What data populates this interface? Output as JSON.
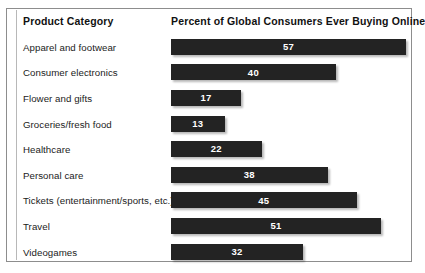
{
  "chart_data": {
    "type": "bar",
    "orientation": "horizontal",
    "title": "",
    "xlabel": "Percent of Global Consumers Ever Buying Online",
    "ylabel": "Product Category",
    "categories": [
      "Apparel and footwear",
      "Consumer electronics",
      "Flower and gifts",
      "Groceries/fresh food",
      "Healthcare",
      "Personal care",
      "Tickets (entertainment/sports, etc.)",
      "Travel",
      "Videogames"
    ],
    "values": [
      57,
      40,
      17,
      13,
      22,
      38,
      45,
      51,
      32
    ],
    "xlim": [
      0,
      57
    ],
    "grid": false,
    "legend": null,
    "data_labels": true,
    "bar_color": "#232323",
    "data_label_color": "#ffffff",
    "background_color": "#ffffff",
    "border_color": "#8d8d8d"
  },
  "table": {
    "headers": {
      "category": "Product Category",
      "percent": "Percent of Global Consumers Ever Buying Online"
    },
    "rows": [
      {
        "label": "Apparel and footwear",
        "value": "57"
      },
      {
        "label": "Consumer electronics",
        "value": "40"
      },
      {
        "label": "Flower and gifts",
        "value": "17"
      },
      {
        "label": "Groceries/fresh food",
        "value": "13"
      },
      {
        "label": "Healthcare",
        "value": "22"
      },
      {
        "label": "Personal care",
        "value": "38"
      },
      {
        "label": "Tickets (entertainment/sports, etc.)",
        "value": "45"
      },
      {
        "label": "Travel",
        "value": "51"
      },
      {
        "label": "Videogames",
        "value": "32"
      }
    ]
  }
}
